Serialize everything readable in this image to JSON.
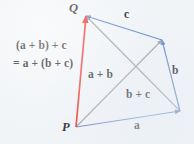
{
  "figure": {
    "background_color": "#f1f4f7",
    "points": {
      "P": {
        "label": "P",
        "x": 76,
        "y": 127
      },
      "Q": {
        "label": "Q",
        "x": 86,
        "y": 16
      },
      "R": {
        "label": "",
        "x": 162,
        "y": 40
      },
      "S": {
        "label": "",
        "x": 180,
        "y": 111
      }
    },
    "edges": [
      {
        "name": "vector-a",
        "label": "a",
        "color": "#5b7fc4",
        "from": "P",
        "to": "S"
      },
      {
        "name": "vector-b",
        "label": "b",
        "color": "#5b7fc4",
        "from": "S",
        "to": "R"
      },
      {
        "name": "vector-c",
        "label": "c",
        "color": "#5b7fc4",
        "from": "R",
        "to": "Q"
      },
      {
        "name": "vector-a-plus-b",
        "label": "a + b",
        "color": "#9a9a9a",
        "from": "P",
        "to": "R"
      },
      {
        "name": "vector-b-plus-c",
        "label": "b + c",
        "color": "#9a9a9a",
        "from": "S",
        "to": "Q"
      },
      {
        "name": "vector-resultant",
        "label": "(a + b) + c",
        "color": "#ee2a24",
        "from": "P",
        "to": "Q"
      }
    ],
    "labels": {
      "point_q": "Q",
      "point_p": "P",
      "vector_c": "c",
      "vector_b": "b",
      "vector_a": "a",
      "vector_ab": "a + b",
      "vector_bc": "b + c",
      "sum_line1": "(a + b) + c",
      "sum_line2": "= a + (b + c)"
    },
    "colors": {
      "blue": "#5b7fc4",
      "gray": "#9a9a9a",
      "red": "#ee2a24",
      "text": "#18181c"
    }
  }
}
